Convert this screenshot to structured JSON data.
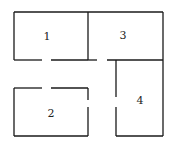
{
  "diagram": {
    "type": "floor-plan",
    "rooms": [
      {
        "id": "1",
        "label": "1",
        "x": 47,
        "y": 40
      },
      {
        "id": "2",
        "label": "2",
        "x": 51,
        "y": 117
      },
      {
        "id": "3",
        "label": "3",
        "x": 123,
        "y": 39
      },
      {
        "id": "4",
        "label": "4",
        "x": 140,
        "y": 104
      }
    ],
    "doors": [
      {
        "between": [
          "1",
          "2"
        ],
        "note": "gap in room 1 bottom wall / room 2 top wall"
      },
      {
        "between": [
          "3",
          "corridor"
        ],
        "note": "gap in room 3 bottom wall"
      },
      {
        "between": [
          "2",
          "corridor"
        ],
        "note": "gap in room 2 right wall"
      },
      {
        "between": [
          "4",
          "corridor"
        ],
        "note": "gap in room 4 left wall"
      }
    ],
    "wall_color": "#1a1a1a"
  }
}
